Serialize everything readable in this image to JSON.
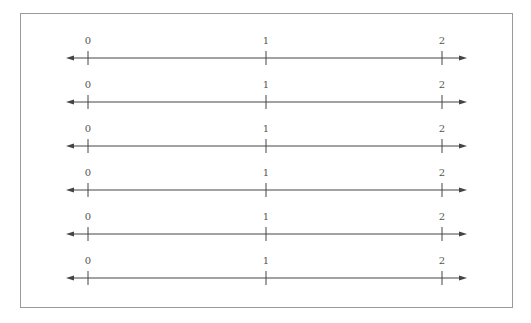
{
  "diagram": {
    "type": "number-lines",
    "count": 6,
    "colors": {
      "frame": "#9a9a9a",
      "line": "#444444",
      "label": "#555555"
    },
    "lines": [
      {
        "ticks": [
          {
            "value": "0",
            "x": 88
          },
          {
            "value": "1",
            "x": 266
          },
          {
            "value": "2",
            "x": 442
          }
        ],
        "y": 58
      },
      {
        "ticks": [
          {
            "value": "0",
            "x": 88
          },
          {
            "value": "1",
            "x": 266
          },
          {
            "value": "2",
            "x": 442
          }
        ],
        "y": 102
      },
      {
        "ticks": [
          {
            "value": "0",
            "x": 88
          },
          {
            "value": "1",
            "x": 266
          },
          {
            "value": "2",
            "x": 442
          }
        ],
        "y": 146
      },
      {
        "ticks": [
          {
            "value": "0",
            "x": 88
          },
          {
            "value": "1",
            "x": 266
          },
          {
            "value": "2",
            "x": 442
          }
        ],
        "y": 190
      },
      {
        "ticks": [
          {
            "value": "0",
            "x": 88
          },
          {
            "value": "1",
            "x": 266
          },
          {
            "value": "2",
            "x": 442
          }
        ],
        "y": 234
      },
      {
        "ticks": [
          {
            "value": "0",
            "x": 88
          },
          {
            "value": "1",
            "x": 266
          },
          {
            "value": "2",
            "x": 442
          }
        ],
        "y": 278
      }
    ],
    "axis": {
      "x_start": 66,
      "x_end": 467
    }
  }
}
